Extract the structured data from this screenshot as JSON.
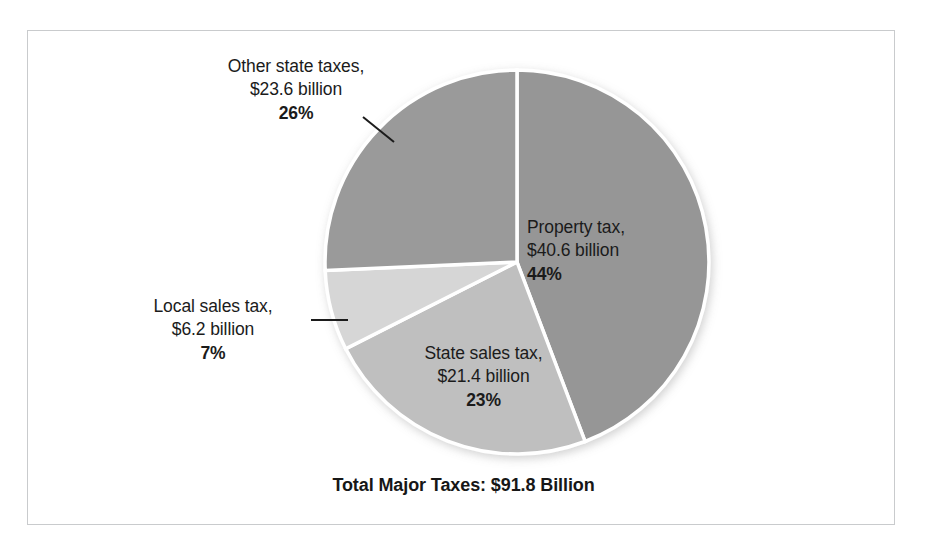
{
  "figure": {
    "border_color": "#c9cbcd",
    "background": "#ffffff"
  },
  "caption": {
    "total_label": "Total Major Taxes: $91.8 Billion"
  },
  "labels": {
    "other": {
      "name": "Other state taxes,",
      "amount": "$23.6 billion",
      "pct": "26%"
    },
    "property": {
      "name": "Property tax,",
      "amount": "$40.6 billion",
      "pct": "44%"
    },
    "local": {
      "name": "Local sales tax,",
      "amount": "$6.2 billion",
      "pct": "7%"
    },
    "state": {
      "name": "State sales tax,",
      "amount": "$21.4 billion",
      "pct": "23%"
    }
  },
  "chart_data": {
    "type": "pie",
    "title": "Total Major Taxes: $91.8 Billion",
    "xlabel": "",
    "ylabel": "",
    "legend_position": "none",
    "grid": false,
    "units": "billion USD",
    "total": 91.8,
    "total_text": "$91.8 Billion",
    "start_angle_deg": 0,
    "direction": "clockwise",
    "categories": [
      "Property tax",
      "State sales tax",
      "Local sales tax",
      "Other state taxes"
    ],
    "values": [
      40.6,
      21.4,
      6.2,
      23.6
    ],
    "percentages": [
      44,
      23,
      7,
      26
    ],
    "colors": [
      "#969696",
      "#bfbfbf",
      "#d6d6d6",
      "#9a9a9a"
    ],
    "slices": [
      {
        "label": "Property tax",
        "value": 40.6,
        "value_text": "$40.6 billion",
        "percent": 44,
        "percent_text": "44%",
        "color": "#969696",
        "start_deg": 0,
        "end_deg": 158.4
      },
      {
        "label": "State sales tax",
        "value": 21.4,
        "value_text": "$21.4 billion",
        "percent": 23,
        "percent_text": "23%",
        "color": "#bfbfbf",
        "start_deg": 158.4,
        "end_deg": 241.2
      },
      {
        "label": "Local sales tax",
        "value": 6.2,
        "value_text": "$6.2 billion",
        "percent": 7,
        "percent_text": "7%",
        "color": "#d6d6d6",
        "start_deg": 241.2,
        "end_deg": 266.4
      },
      {
        "label": "Other state taxes",
        "value": 23.6,
        "value_text": "$23.6 billion",
        "percent": 26,
        "percent_text": "26%",
        "color": "#9a9a9a",
        "start_deg": 266.4,
        "end_deg": 360
      }
    ]
  }
}
